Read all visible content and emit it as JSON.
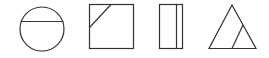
{
  "figure": {
    "stroke_color": "#333333",
    "background": "#ffffff",
    "shapes": [
      {
        "name": "circle-with-chord",
        "type": "circle"
      },
      {
        "name": "square-with-corner-cut",
        "type": "square"
      },
      {
        "name": "rectangle-with-vertical-divider",
        "type": "rectangle"
      },
      {
        "name": "triangle-with-inner-line",
        "type": "triangle"
      }
    ]
  }
}
